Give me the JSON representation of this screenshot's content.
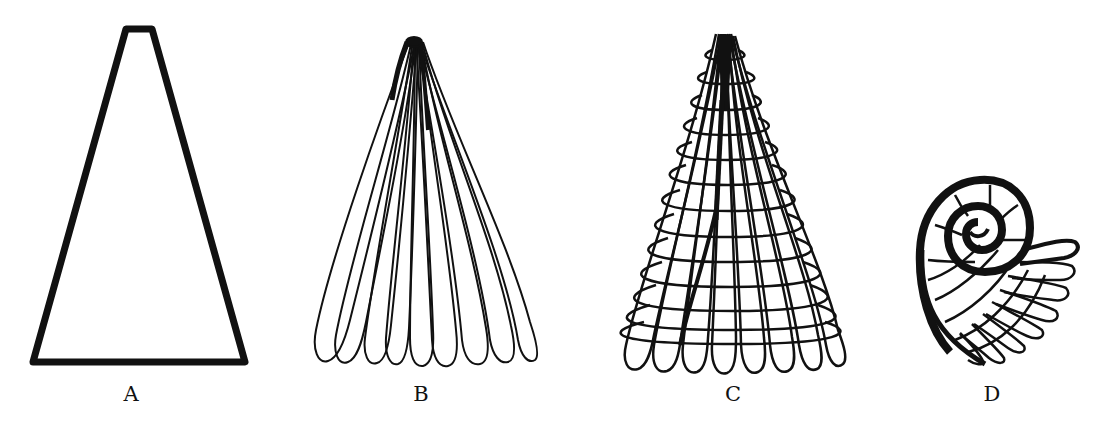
{
  "figure": {
    "panels": [
      {
        "id": "A",
        "label": "A",
        "description": "solid truncated cone outline (trapezoid)"
      },
      {
        "id": "B",
        "label": "B",
        "description": "fan of elongated loops converging at apex"
      },
      {
        "id": "C",
        "label": "C",
        "description": "cone of loops with horizontal growth rings"
      },
      {
        "id": "D",
        "label": "D",
        "description": "coiled spiral with radiating loops"
      }
    ],
    "colors": {
      "ink": "#111111",
      "background": "#ffffff"
    }
  }
}
